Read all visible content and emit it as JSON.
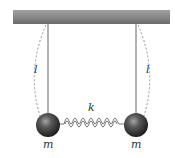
{
  "diagram": {
    "labels": {
      "left_length": "l",
      "right_length": "l",
      "spring_constant": "k",
      "left_mass": "m",
      "right_mass": "m"
    },
    "colors": {
      "ceiling_top": "#9a9a9a",
      "ceiling_bottom": "#6e6e6e",
      "string": "#555555",
      "dashed_arc": "#8a8a8a",
      "spring": "#6a6a6a",
      "ball_highlight": "#9a9a9a",
      "ball_dark": "#1e1e1e",
      "text": "#333333"
    },
    "components": [
      "ceiling",
      "left-string",
      "right-string",
      "left-arc",
      "right-arc",
      "left-ball",
      "right-ball",
      "spring"
    ]
  }
}
